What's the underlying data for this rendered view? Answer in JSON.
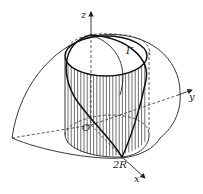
{
  "figure": {
    "labels": {
      "z_axis": "z",
      "y_axis": "y",
      "x_axis": "x",
      "origin": "O",
      "curve": "Γ",
      "radius_mark": "2R"
    }
  }
}
